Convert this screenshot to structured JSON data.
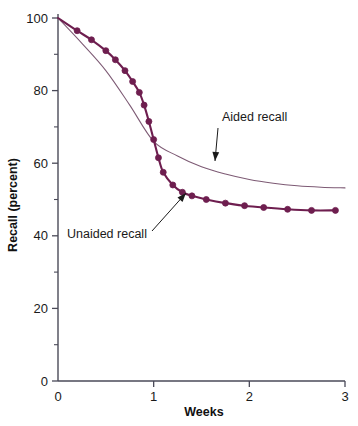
{
  "chart_data": {
    "type": "line",
    "title": "",
    "subtitle": "",
    "xlabel": "Weeks",
    "ylabel": "Recall (percent)",
    "xlim": [
      0,
      3
    ],
    "ylim": [
      0,
      100
    ],
    "grid": false,
    "legend_position": "annotations-inline",
    "x_ticks": [
      0,
      1,
      2,
      3
    ],
    "x_tick_labels": [
      "0",
      "1",
      "2",
      "3"
    ],
    "y_ticks": [
      0,
      20,
      40,
      60,
      80,
      100
    ],
    "y_tick_labels": [
      "0",
      "20",
      "40",
      "60",
      "80",
      "100"
    ],
    "y_minor_ticks": [
      10,
      30,
      50,
      70,
      90
    ],
    "series": [
      {
        "name": "Unaided recall",
        "color": "#6e1e4f",
        "markers": true,
        "marker_shape": "circle",
        "x": [
          0.0,
          0.2,
          0.35,
          0.5,
          0.6,
          0.7,
          0.78,
          0.85,
          0.9,
          0.95,
          1.0,
          1.05,
          1.1,
          1.2,
          1.3,
          1.4,
          1.55,
          1.75,
          1.95,
          2.15,
          2.4,
          2.65,
          2.9
        ],
        "values": [
          100.0,
          96.5,
          94.0,
          91.0,
          88.5,
          85.5,
          82.5,
          79.5,
          76.0,
          71.5,
          66.5,
          61.5,
          57.5,
          54.0,
          52.0,
          51.0,
          50.0,
          49.0,
          48.3,
          47.8,
          47.3,
          47.0,
          47.0
        ]
      },
      {
        "name": "Aided recall",
        "color": "#7d5a74",
        "markers": false,
        "marker_shape": "none",
        "x": [
          0.0,
          0.25,
          0.5,
          0.75,
          1.0,
          1.25,
          1.5,
          1.75,
          2.0,
          2.25,
          2.5,
          2.75,
          3.0
        ],
        "values": [
          100.0,
          93.0,
          85.5,
          76.0,
          66.0,
          62.0,
          59.0,
          57.0,
          55.5,
          54.5,
          53.8,
          53.4,
          53.2
        ]
      }
    ],
    "annotations": [
      {
        "id": "aided-annotation",
        "label": "Aided recall",
        "label_x": 222,
        "label_y": 121,
        "arrow_from_x": 218,
        "arrow_from_y": 128,
        "arrow_to_x": 215,
        "arrow_to_y": 161
      },
      {
        "id": "unaided-annotation",
        "label": "Unaided recall",
        "label_x": 67,
        "label_y": 238,
        "arrow_from_x": 152,
        "arrow_from_y": 231,
        "arrow_to_x": 186,
        "arrow_to_y": 193
      }
    ]
  }
}
